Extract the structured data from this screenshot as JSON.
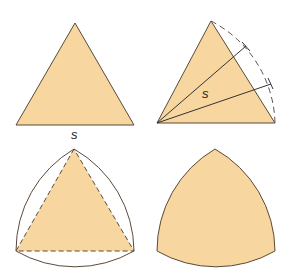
{
  "figure": {
    "colors": {
      "fill": "#f7d6a0",
      "stroke": "#5a4a3a",
      "dashed": "#555555",
      "background": "#ffffff"
    },
    "panels": [
      {
        "id": "equilateral-triangle",
        "label": "s"
      },
      {
        "id": "arc-construction",
        "label": "s"
      },
      {
        "id": "triangle-with-arcs",
        "label": ""
      },
      {
        "id": "reuleaux-triangle",
        "label": ""
      }
    ]
  }
}
